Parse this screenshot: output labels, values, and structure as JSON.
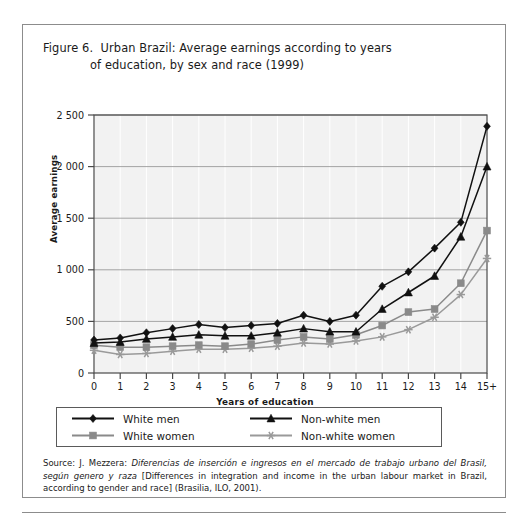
{
  "figure": {
    "title_line_1": "Figure 6.  Urban Brazil: Average earnings according to years",
    "title_line_2": "of education, by sex and race (1999)"
  },
  "source": {
    "prefix": "Source: J. Mezzera: ",
    "italic_title": "Diferencias de inserción e ingresos en el mercado de trabajo urbano del Brasil, según genero y raza",
    "suffix": " [Differences in integration and income in the urban labour market in Brazil, according to gender and race] (Brasilia, ILO, 2001)."
  },
  "legend": {
    "entries": [
      {
        "label": "White men",
        "marker": "diamond-marker",
        "color": "#111111"
      },
      {
        "label": "Non-white men",
        "marker": "triangle-marker",
        "color": "#111111"
      },
      {
        "label": "White women",
        "marker": "square-marker",
        "color": "#8a8a8a"
      },
      {
        "label": "Non-white women",
        "marker": "asterisk-marker",
        "color": "#9a9a9a"
      }
    ]
  },
  "chart_data": {
    "type": "line",
    "title": "Urban Brazil: Average earnings according to years of education, by sex and race (1999)",
    "xlabel": "Years of education",
    "ylabel": "Average earnings",
    "categories": [
      "0",
      "1",
      "2",
      "3",
      "4",
      "5",
      "6",
      "7",
      "8",
      "9",
      "10",
      "11",
      "12",
      "13",
      "14",
      "15+"
    ],
    "ylim": [
      0,
      2500
    ],
    "yticks": [
      0,
      500,
      1000,
      1500,
      2000,
      2500
    ],
    "ytick_labels": [
      "0",
      "500",
      "1 000",
      "1 500",
      "2 000",
      "2 500"
    ],
    "grid": true,
    "legend_position": "below-plot",
    "series": [
      {
        "name": "White men",
        "marker": "diamond",
        "color": "#111111",
        "values": [
          320,
          340,
          390,
          430,
          470,
          440,
          460,
          480,
          560,
          500,
          560,
          840,
          980,
          1210,
          1460,
          2390
        ]
      },
      {
        "name": "Non-white men",
        "marker": "triangle",
        "color": "#111111",
        "values": [
          290,
          300,
          330,
          350,
          370,
          360,
          360,
          390,
          430,
          400,
          400,
          620,
          780,
          940,
          1320,
          2000
        ]
      },
      {
        "name": "White women",
        "marker": "square",
        "color": "#8a8a8a",
        "values": [
          270,
          250,
          250,
          260,
          270,
          260,
          280,
          320,
          350,
          330,
          370,
          460,
          590,
          620,
          870,
          1380
        ]
      },
      {
        "name": "Non-white women",
        "marker": "asterisk",
        "color": "#9a9a9a",
        "values": [
          220,
          180,
          190,
          210,
          230,
          230,
          240,
          260,
          290,
          280,
          310,
          350,
          420,
          540,
          760,
          1110
        ]
      }
    ]
  }
}
